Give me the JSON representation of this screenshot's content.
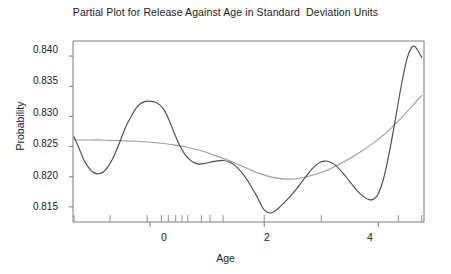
{
  "chart_data": {
    "type": "line",
    "title": "Partial Plot for Release Against Age in Standard  Deviation Units",
    "xlabel": "Age",
    "ylabel": "Probability",
    "xlim": [
      -1.35,
      4.8
    ],
    "ylim": [
      0.8125,
      0.8425
    ],
    "grid": false,
    "legend": "none",
    "xticks": [
      0,
      2,
      4
    ],
    "xtick_labels": [
      "0",
      "2",
      "4"
    ],
    "yticks": [
      0.815,
      0.82,
      0.825,
      0.83,
      0.835,
      0.84
    ],
    "ytick_labels": [
      "0.815",
      "0.820",
      "0.825",
      "0.830",
      "0.835",
      "0.840"
    ],
    "series": [
      {
        "name": "spline-fit",
        "style": "solid",
        "color": "#4a4a52",
        "x": [
          -1.33,
          -1.24,
          -1.15,
          -1.05,
          -0.97,
          -0.9,
          -0.82,
          -0.74,
          -0.66,
          -0.58,
          -0.5,
          -0.42,
          -0.33,
          -0.25,
          -0.17,
          -0.08,
          0.0,
          0.08,
          0.16,
          0.23,
          0.29,
          0.35,
          0.41,
          0.47,
          0.54,
          0.62,
          0.7,
          0.78,
          0.86,
          0.95,
          1.05,
          1.16,
          1.28,
          1.4,
          1.52,
          1.64,
          1.76,
          1.88,
          2.0,
          2.12,
          2.24,
          2.36,
          2.48,
          2.6,
          2.72,
          2.84,
          2.96,
          3.06,
          3.16,
          3.26,
          3.38,
          3.5,
          3.62,
          3.74,
          3.84,
          3.92,
          4.0,
          4.1,
          4.2,
          4.3,
          4.4,
          4.5,
          4.58,
          4.64,
          4.7,
          4.76
        ],
        "y": [
          0.8266,
          0.8246,
          0.8226,
          0.8212,
          0.8206,
          0.8205,
          0.8208,
          0.8216,
          0.8229,
          0.8246,
          0.8265,
          0.8284,
          0.83,
          0.8313,
          0.8321,
          0.8325,
          0.8325,
          0.8324,
          0.832,
          0.8313,
          0.8303,
          0.829,
          0.8276,
          0.8262,
          0.8248,
          0.8236,
          0.8228,
          0.8223,
          0.8221,
          0.8222,
          0.8224,
          0.8226,
          0.8227,
          0.8224,
          0.8216,
          0.8203,
          0.8186,
          0.8166,
          0.8145,
          0.814,
          0.8147,
          0.8158,
          0.817,
          0.8184,
          0.8199,
          0.8213,
          0.8223,
          0.8226,
          0.8224,
          0.8218,
          0.8206,
          0.8192,
          0.8178,
          0.8167,
          0.8162,
          0.8163,
          0.8172,
          0.82,
          0.8244,
          0.8296,
          0.835,
          0.8395,
          0.8414,
          0.8416,
          0.8408,
          0.8398
        ]
      },
      {
        "name": "smooth-trend",
        "style": "solid",
        "color": "#9a9aa2",
        "x": [
          -1.33,
          -1.1,
          -0.85,
          -0.6,
          -0.35,
          -0.1,
          0.15,
          0.4,
          0.65,
          0.9,
          1.15,
          1.4,
          1.65,
          1.9,
          2.15,
          2.4,
          2.65,
          2.9,
          3.15,
          3.4,
          3.65,
          3.9,
          4.15,
          4.4,
          4.6,
          4.76
        ],
        "y": [
          0.8261,
          0.8261,
          0.8261,
          0.826,
          0.8259,
          0.8258,
          0.8256,
          0.8253,
          0.8249,
          0.8243,
          0.8235,
          0.8226,
          0.8216,
          0.8206,
          0.8199,
          0.8196,
          0.8198,
          0.8204,
          0.8213,
          0.8225,
          0.8239,
          0.8255,
          0.8274,
          0.8297,
          0.8318,
          0.8335
        ]
      }
    ],
    "rug_marks": [
      -1.33,
      -0.7,
      -0.05,
      0.2,
      0.32,
      0.45,
      0.56,
      0.66,
      0.9,
      1.05,
      1.28,
      2.0,
      3.0,
      4.35,
      4.76
    ],
    "rug_axis": "x-bottom"
  },
  "axes": {
    "spine_color": "#7a7a7a",
    "tick_color": "#7a7a7a"
  }
}
